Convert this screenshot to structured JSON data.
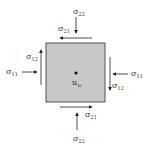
{
  "diagram": {
    "colors": {
      "element_fill": "#c8c8c8",
      "element_border": "#555555",
      "arrow": "#222222",
      "text": "#333333"
    },
    "element": {
      "center_label_main": "u",
      "center_label_sub": "w"
    },
    "labels": {
      "top_normal": {
        "main": "σ",
        "sub": "22"
      },
      "top_shear": {
        "main": "σ",
        "sub": "21"
      },
      "left_normal": {
        "main": "σ",
        "sub": "11"
      },
      "left_shear": {
        "main": "σ",
        "sub": "12"
      },
      "right_normal": {
        "main": "σ",
        "sub": "11"
      },
      "right_shear": {
        "main": "σ",
        "sub": "12"
      },
      "bottom_normal": {
        "main": "σ",
        "sub": "22"
      },
      "bottom_shear": {
        "main": "σ",
        "sub": "21"
      }
    }
  }
}
